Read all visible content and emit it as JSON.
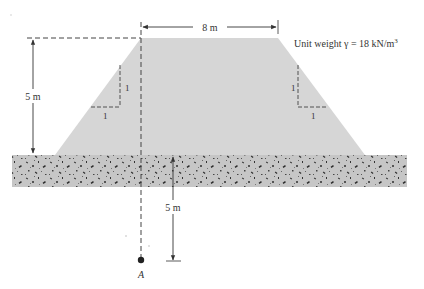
{
  "figure": {
    "embankment": {
      "top_width_label": "8 m",
      "height_label": "5 m",
      "unit_weight_label": "Unit weight γ = 18 kN/m",
      "unit_weight_superscript": "3",
      "fill_color": "#d4d4d4"
    },
    "slopes": {
      "left": {
        "vertical_label": "1",
        "horizontal_label": "1"
      },
      "right": {
        "vertical_label": "1",
        "horizontal_label": "1"
      }
    },
    "soil_layer": {
      "fill_color": "#c4c4c4",
      "speckle_color": "#3a3a3a"
    },
    "depth_dimension": {
      "label": "5 m"
    },
    "point": {
      "label": "A"
    },
    "colors": {
      "line": "#333333",
      "dash": "#444444"
    }
  }
}
